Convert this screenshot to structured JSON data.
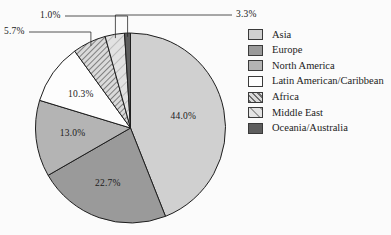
{
  "figure": {
    "cropped_top_text": "",
    "background_color": "#fbfbfb"
  },
  "legend": {
    "position": "right",
    "items": [
      {
        "label": "Asia",
        "color": "#d0d0d0",
        "pattern": "solid"
      },
      {
        "label": "Europe",
        "color": "#9a9a9a",
        "pattern": "solid"
      },
      {
        "label": "North America",
        "color": "#b4b4b4",
        "pattern": "solid"
      },
      {
        "label": "Latin American/Caribbean",
        "color": "#fdfdfd",
        "pattern": "solid"
      },
      {
        "label": "Africa",
        "color": "#c4c4c4",
        "pattern": "dense-diagonal-hatch"
      },
      {
        "label": "Middle East",
        "color": "#dcdcdc",
        "pattern": "sparse-diagonal-hatch"
      },
      {
        "label": "Oceania/Australia",
        "color": "#5e5e5e",
        "pattern": "solid"
      }
    ]
  },
  "chart_data": {
    "type": "pie",
    "title": "",
    "categories": [
      "Asia",
      "Europe",
      "North America",
      "Latin American/Caribbean",
      "Africa",
      "Middle East",
      "Oceania/Australia"
    ],
    "values": [
      44.0,
      22.7,
      13.0,
      10.3,
      5.7,
      3.3,
      1.0
    ],
    "value_labels": [
      "44.0%",
      "22.7%",
      "13.0%",
      "10.3%",
      "5.7%",
      "3.3%",
      "1.0%"
    ],
    "colors": [
      "#d0d0d0",
      "#9a9a9a",
      "#b4b4b4",
      "#fdfdfd",
      "#c4c4c4",
      "#dcdcdc",
      "#5e5e5e"
    ],
    "patterns": [
      "solid",
      "solid",
      "solid",
      "solid",
      "dense-diagonal-hatch",
      "sparse-diagonal-hatch",
      "solid"
    ],
    "units": "percent",
    "total": 100.0,
    "start_angle_deg": 0,
    "direction": "clockwise",
    "legend_position": "right",
    "grid": false,
    "labels_with_leader_lines": [
      "5.7%",
      "3.3%",
      "1.0%"
    ],
    "labels_inside": [
      "44.0%",
      "22.7%",
      "13.0%",
      "10.3%"
    ]
  }
}
